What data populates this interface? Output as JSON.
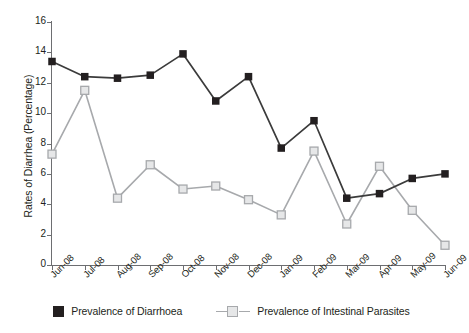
{
  "chart_data": {
    "type": "line",
    "title": "",
    "xlabel": "",
    "ylabel": "Rates of Diarrhea (Percentage)",
    "ylim": [
      0,
      16
    ],
    "yticks": [
      0,
      2,
      4,
      6,
      8,
      10,
      12,
      14,
      16
    ],
    "grid": false,
    "legend_position": "bottom",
    "categories": [
      "Jun-08",
      "Jul-08",
      "Aug-08",
      "Sep-08",
      "Oct-08",
      "Nov-08",
      "Dec-08",
      "Jan-09",
      "Feb-09",
      "Mar-09",
      "Apr-09",
      "May-09",
      "Jun-09"
    ],
    "series": [
      {
        "name": "Prevalence of Diarrhoea",
        "color": "#3b3b3b",
        "marker": "filled-square",
        "values": [
          13.4,
          12.4,
          12.3,
          12.5,
          13.9,
          10.8,
          12.4,
          7.7,
          9.5,
          4.4,
          4.7,
          5.7,
          6.0
        ]
      },
      {
        "name": "Prevalence of Intestinal Parasites",
        "color": "#a7a9ac",
        "marker": "open-square",
        "values": [
          7.3,
          11.5,
          4.4,
          6.6,
          5.0,
          5.2,
          4.3,
          3.3,
          7.5,
          2.7,
          6.5,
          3.6,
          1.3
        ]
      }
    ]
  },
  "legend": {
    "items": [
      {
        "label": "Prevalence of Diarrhoea",
        "swatch": "filled-square-swatch"
      },
      {
        "label": "Prevalence of Intestinal Parasites",
        "swatch": "open-square-line-swatch"
      }
    ]
  },
  "colors": {
    "dark_series": "#3b3b3b",
    "light_series": "#a7a9ac",
    "light_marker_fill": "#e6e7e8",
    "axis": "#6d6e71",
    "text": "#231f20",
    "background": "#ffffff"
  }
}
